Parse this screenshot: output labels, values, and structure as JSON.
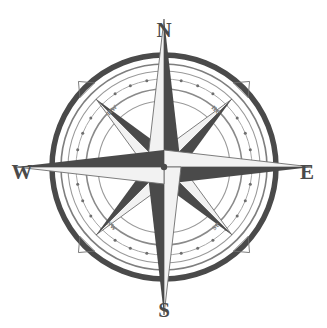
{
  "figure": {
    "name": "compass-rose",
    "background_color": "#ffffff"
  },
  "colors": {
    "dark": "#4a4a4a",
    "mid": "#6e6e6e",
    "light_fill": "#f2f2f2",
    "ring_stroke": "#5a5a5a",
    "thin_ring_stroke": "#8a8a8a",
    "dot": "#6e6e6e",
    "label_dark": "#4a4a4a",
    "label_ordinal": "#7d7d7d"
  },
  "geometry": {
    "center_x": 164,
    "center_y": 167,
    "outer_ring_radius": 112,
    "inner_ring_radius": 103,
    "dotted_ring_radius": 88,
    "thin_ring_radius": 78,
    "innermost_ring_radius": 66,
    "major_point_length": 148,
    "minor_point_length": 96,
    "dot_count": 32
  },
  "cardinals": [
    {
      "id": "north",
      "label": "N",
      "abbr": "N",
      "angle_deg": 0,
      "x": 164,
      "y": 32
    },
    {
      "id": "east",
      "label": "E",
      "abbr": "E",
      "angle_deg": 90,
      "x": 307,
      "y": 174
    },
    {
      "id": "south",
      "label": "S",
      "abbr": "S",
      "angle_deg": 180,
      "x": 164,
      "y": 312
    },
    {
      "id": "west",
      "label": "W",
      "abbr": "W",
      "angle_deg": 270,
      "x": 22,
      "y": 174
    }
  ],
  "ordinals": [
    {
      "id": "northwest",
      "label": "nw",
      "angle_deg": 315,
      "x": 112,
      "y": 110,
      "rotation": -45
    },
    {
      "id": "northeast",
      "label": "ne",
      "angle_deg": 45,
      "x": 216,
      "y": 110,
      "rotation": 45
    },
    {
      "id": "southeast",
      "label": "se",
      "angle_deg": 135,
      "x": 216,
      "y": 226,
      "rotation": -45
    },
    {
      "id": "southwest",
      "label": "sw",
      "angle_deg": 225,
      "x": 112,
      "y": 226,
      "rotation": 45
    }
  ],
  "tick_markers": {
    "name": "outer-arrow-ticks",
    "count": 4,
    "at_angles_deg": [
      45,
      135,
      225,
      315
    ]
  }
}
